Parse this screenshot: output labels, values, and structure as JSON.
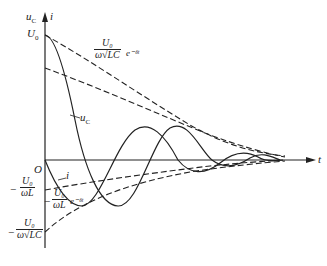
{
  "figure": {
    "axes": {
      "y_label_1": "u",
      "y_label_1_sub": "C",
      "y_label_2": "i",
      "x_label": "t",
      "origin": "O"
    },
    "labels": {
      "u0": "U",
      "u0_sub": "0",
      "upper_env_num": "U₀",
      "upper_env_den": "ω√LC",
      "upper_env_exp": "e⁻ᵟᵗ",
      "uc_curve": "u",
      "uc_curve_sub": "C",
      "i_curve": "i",
      "neg_u0_wl_num": "U₀",
      "neg_u0_wl_den": "ωL",
      "lower_env_num": "U₀",
      "lower_env_den": "ωL",
      "lower_env_exp": "e⁻ᵟᵗ",
      "neg_u0_wlc_num": "U₀",
      "neg_u0_wlc_den": "ω√LC",
      "minus": "−"
    },
    "colors": {
      "line": "#222222",
      "background": "#ffffff"
    }
  }
}
